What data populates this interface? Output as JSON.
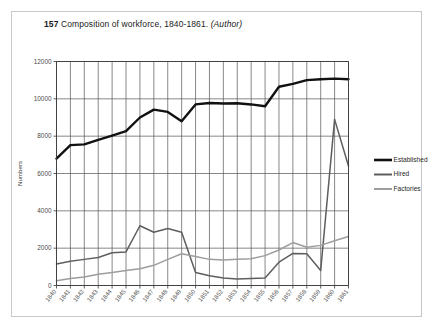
{
  "figure": {
    "number": "157",
    "caption": "Composition of workforce, 1840-1861.",
    "source": "(Author)"
  },
  "chart_data": {
    "type": "line",
    "title": "Composition of workforce, 1840-1861.",
    "xlabel": "",
    "ylabel": "Numbers",
    "ylim": [
      0,
      12000
    ],
    "ytick_labels": [
      "0",
      "2000",
      "4000",
      "6000",
      "8000",
      "10000",
      "12000"
    ],
    "ytick_values": [
      0,
      2000,
      4000,
      6000,
      8000,
      10000,
      12000
    ],
    "grid": true,
    "legend_position": "right",
    "categories": [
      "1840",
      "1841",
      "1842",
      "1843",
      "1844",
      "1845",
      "1846",
      "1847",
      "1848",
      "1849",
      "1850",
      "1851",
      "1852",
      "1853",
      "1854",
      "1855",
      "1856",
      "1857",
      "1858",
      "1859",
      "1860",
      "1861"
    ],
    "series": [
      {
        "name": "Established",
        "color": "#111111",
        "width": 2.4,
        "values": [
          6800,
          7520,
          7560,
          7800,
          8030,
          8270,
          9000,
          9420,
          9300,
          8800,
          9700,
          9780,
          9750,
          9760,
          9700,
          9600,
          10650,
          10800,
          11000,
          11050,
          11080,
          11050
        ]
      },
      {
        "name": "Hired",
        "color": "#5e5e5e",
        "width": 1.5,
        "values": [
          1150,
          1300,
          1400,
          1500,
          1750,
          1800,
          3200,
          2850,
          3050,
          2850,
          700,
          520,
          400,
          350,
          380,
          400,
          1250,
          1720,
          1700,
          800,
          8900,
          6400
        ]
      },
      {
        "name": "Factories",
        "color": "#9d9d9d",
        "width": 1.5,
        "values": [
          250,
          380,
          450,
          600,
          700,
          800,
          900,
          1080,
          1400,
          1700,
          1550,
          1400,
          1370,
          1400,
          1430,
          1600,
          1900,
          2300,
          2050,
          2150,
          2400,
          2620
        ]
      }
    ]
  },
  "legend": {
    "items": [
      {
        "label": "Established"
      },
      {
        "label": "Hired"
      },
      {
        "label": "Factories"
      }
    ]
  }
}
